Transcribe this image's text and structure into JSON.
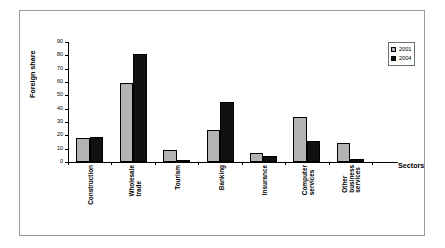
{
  "chart_data": {
    "type": "bar",
    "title": "",
    "xlabel": "Sectors",
    "ylabel": "Foreign share",
    "ylim": [
      0,
      90
    ],
    "ytick_labels": [
      "0",
      "10",
      "20",
      "30",
      "40",
      "50",
      "60",
      "70",
      "80",
      "90"
    ],
    "ytick_values": [
      0,
      10,
      20,
      30,
      40,
      50,
      60,
      70,
      80,
      90
    ],
    "grid": false,
    "legend_position": "top-right",
    "categories": [
      "Construction",
      "Wholesale\ntrade",
      "Tourism",
      "Banking",
      "Insurance",
      "Computer\nservices",
      "Other\nbusiness\nservices"
    ],
    "series": [
      {
        "name": "2001",
        "color": "#b3b3b3",
        "values": [
          18,
          59,
          9,
          24,
          7,
          34,
          14
        ]
      },
      {
        "name": "2004",
        "color": "#111111",
        "values": [
          19,
          81,
          0.5,
          45,
          4.5,
          16,
          2
        ]
      }
    ]
  },
  "legend": {
    "entries": [
      {
        "label": "2001",
        "swatch": "legend-swatch-2001"
      },
      {
        "label": "2004",
        "swatch": "legend-swatch-2004"
      }
    ]
  }
}
